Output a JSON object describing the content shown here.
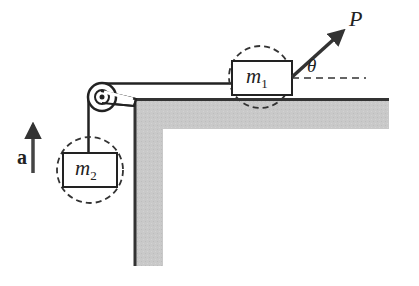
{
  "diagram": {
    "colors": {
      "line": "#222222",
      "surface_fill": "#c8c8c8",
      "surface_edge": "#333333",
      "background": "#ffffff"
    },
    "labels": {
      "m1": {
        "symbol": "m",
        "subscript": "1"
      },
      "m2": {
        "symbol": "m",
        "subscript": "2"
      },
      "force": "P",
      "angle": "θ",
      "acceleration": "a"
    },
    "elements": [
      {
        "id": "block-m1",
        "kind": "block",
        "label": "m1",
        "on": "horizontal-surface"
      },
      {
        "id": "block-m2",
        "kind": "block",
        "label": "m2",
        "hanging": true
      },
      {
        "id": "pulley",
        "kind": "pulley",
        "mounted_at": "table-corner"
      },
      {
        "id": "force-p",
        "kind": "force-arrow",
        "label": "P",
        "angle_label": "θ"
      },
      {
        "id": "accel-a",
        "kind": "acceleration-arrow",
        "label": "a",
        "direction": "up"
      }
    ]
  }
}
